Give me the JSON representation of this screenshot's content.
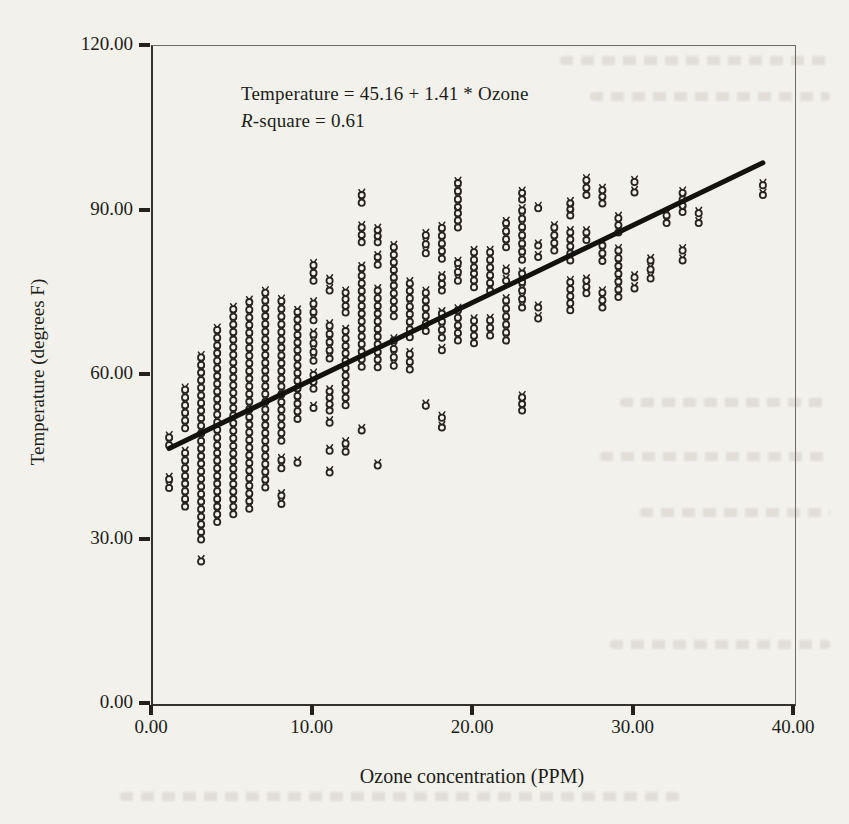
{
  "page": {
    "paper_color": "#f3f1ec",
    "ink_color": "#262320"
  },
  "chart_data": {
    "type": "scatter",
    "title": "",
    "xlabel": "Ozone concentration (PPM)",
    "ylabel": "Temperature (degrees F)",
    "xlim": [
      0,
      40
    ],
    "ylim": [
      0,
      120
    ],
    "grid": false,
    "legend": "none",
    "marker": "open-circle",
    "annotation_line1": "Temperature = 45.16 + 1.41 * Ozone",
    "annotation_line2_prefix": "R",
    "annotation_line2_suffix": "-square = 0.61",
    "regression": {
      "intercept": 45.16,
      "slope": 1.41,
      "r_square": 0.61,
      "x1": 1.0,
      "y1": 46.6,
      "x2": 38.0,
      "y2": 98.7
    },
    "x_ticks": [
      {
        "v": 0,
        "label": "0.00"
      },
      {
        "v": 10,
        "label": "10.00"
      },
      {
        "v": 20,
        "label": "20.00"
      },
      {
        "v": 30,
        "label": "30.00"
      },
      {
        "v": 40,
        "label": "40.00"
      }
    ],
    "y_ticks": [
      {
        "v": 0,
        "label": "0.00"
      },
      {
        "v": 30,
        "label": "30.00"
      },
      {
        "v": 60,
        "label": "60.00"
      },
      {
        "v": 90,
        "label": "90.00"
      },
      {
        "v": 120,
        "label": "120.00"
      }
    ],
    "point_step_degF": 1.4,
    "columns": [
      {
        "x": 1,
        "runs": [
          [
            48.6,
            47.2
          ]
        ],
        "singles": [
          41.0,
          39.4
        ]
      },
      {
        "x": 2,
        "runs": [
          [
            57.3,
            50.3
          ],
          [
            45.8,
            36.0
          ]
        ],
        "singles": []
      },
      {
        "x": 3,
        "runs": [
          [
            63.2,
            30.0
          ]
        ],
        "singles": [
          26.0
        ]
      },
      {
        "x": 4,
        "runs": [
          [
            68.2,
            33.2
          ]
        ],
        "singles": []
      },
      {
        "x": 5,
        "runs": [
          [
            72.0,
            34.6
          ]
        ],
        "singles": []
      },
      {
        "x": 6,
        "runs": [
          [
            73.3,
            35.6
          ]
        ],
        "singles": []
      },
      {
        "x": 7,
        "runs": [
          [
            75.0,
            39.5
          ]
        ],
        "singles": []
      },
      {
        "x": 8,
        "runs": [
          [
            73.5,
            48.0
          ]
        ],
        "singles": [
          44.5,
          43.0,
          38.0,
          36.5
        ]
      },
      {
        "x": 9,
        "runs": [
          [
            71.5,
            52.0
          ]
        ],
        "singles": [
          44.0
        ]
      },
      {
        "x": 10,
        "runs": [
          [
            80.0,
            77.2
          ],
          [
            73.0,
            70.0
          ],
          [
            67.4,
            62.6
          ],
          [
            60.0,
            57.5
          ]
        ],
        "singles": [
          54.0
        ]
      },
      {
        "x": 11,
        "runs": [
          [
            77.2,
            75.4
          ],
          [
            69.0,
            63.0
          ],
          [
            57.0,
            53.5
          ]
        ],
        "singles": [
          51.3,
          46.2,
          42.2
        ]
      },
      {
        "x": 12,
        "runs": [
          [
            75.0,
            71.4
          ],
          [
            68.0,
            54.5
          ]
        ],
        "singles": [
          47.5,
          46.0
        ]
      },
      {
        "x": 13,
        "runs": [
          [
            92.8,
            91.4
          ],
          [
            86.9,
            84.2
          ],
          [
            79.5,
            61.5
          ]
        ],
        "singles": [
          49.9
        ]
      },
      {
        "x": 14,
        "runs": [
          [
            86.4,
            84.2
          ],
          [
            81.5,
            80.1
          ],
          [
            75.4,
            61.4
          ]
        ],
        "singles": [
          43.5
        ]
      },
      {
        "x": 15,
        "runs": [
          [
            83.3,
            77.8
          ],
          [
            76.3,
            70.7
          ],
          [
            66.3,
            61.7
          ]
        ],
        "singles": []
      },
      {
        "x": 16,
        "runs": [
          [
            76.7,
            74.0
          ],
          [
            72.5,
            66.9
          ],
          [
            63.8,
            61.0
          ]
        ],
        "singles": []
      },
      {
        "x": 17,
        "runs": [
          [
            85.5,
            82.2
          ],
          [
            75.0,
            68.0
          ]
        ],
        "singles": [
          54.4
        ]
      },
      {
        "x": 18,
        "runs": [
          [
            86.8,
            81.2
          ],
          [
            77.8,
            75.4
          ],
          [
            71.2,
            66.8
          ]
        ],
        "singles": [
          64.5,
          52.2,
          50.4
        ]
      },
      {
        "x": 19,
        "runs": [
          [
            95.0,
            90.6
          ],
          [
            89.5,
            86.9
          ],
          [
            80.4,
            77.2
          ],
          [
            71.8,
            66.3
          ]
        ],
        "singles": []
      },
      {
        "x": 20,
        "runs": [
          [
            82.4,
            79.6
          ],
          [
            78.5,
            76.0
          ],
          [
            69.9,
            65.8
          ]
        ],
        "singles": []
      },
      {
        "x": 21,
        "runs": [
          [
            82.4,
            75.4
          ],
          [
            70.0,
            67.2
          ]
        ],
        "singles": []
      },
      {
        "x": 22,
        "runs": [
          [
            87.7,
            83.3
          ],
          [
            79.0,
            77.2
          ],
          [
            73.6,
            66.3
          ]
        ],
        "singles": []
      },
      {
        "x": 23,
        "runs": [
          [
            93.2,
            92.0
          ],
          [
            90.0,
            81.0
          ],
          [
            78.5,
            72.3
          ],
          [
            55.9,
            53.5
          ]
        ],
        "singles": []
      },
      {
        "x": 24,
        "runs": [
          [
            83.6,
            81.5
          ],
          [
            72.3,
            70.3
          ]
        ],
        "singles": [
          90.4
        ]
      },
      {
        "x": 25,
        "runs": [
          [
            86.9,
            82.7
          ]
        ],
        "singles": []
      },
      {
        "x": 26,
        "runs": [
          [
            91.3,
            89.1
          ],
          [
            86.0,
            80.9
          ],
          [
            76.9,
            71.8
          ]
        ],
        "singles": []
      },
      {
        "x": 27,
        "runs": [
          [
            95.5,
            92.8
          ],
          [
            86.0,
            84.6
          ],
          [
            77.2,
            74.9
          ]
        ],
        "singles": []
      },
      {
        "x": 28,
        "runs": [
          [
            93.7,
            91.3
          ],
          [
            83.6,
            80.8
          ],
          [
            75.0,
            72.3
          ]
        ],
        "singles": []
      },
      {
        "x": 29,
        "runs": [
          [
            88.6,
            86.0
          ],
          [
            82.7,
            74.2
          ]
        ],
        "singles": []
      },
      {
        "x": 30,
        "runs": [
          [
            95.2,
            93.3
          ],
          [
            77.8,
            75.8
          ]
        ],
        "singles": []
      },
      {
        "x": 31,
        "runs": [
          [
            80.9,
            77.6
          ]
        ],
        "singles": []
      },
      {
        "x": 32,
        "runs": [
          [
            89.1,
            87.7
          ]
        ],
        "singles": []
      },
      {
        "x": 33,
        "runs": [
          [
            93.2,
            89.7
          ],
          [
            82.7,
            80.9
          ]
        ],
        "singles": []
      },
      {
        "x": 34,
        "runs": [
          [
            89.5,
            87.7
          ]
        ],
        "singles": []
      },
      {
        "x": 38,
        "runs": [
          [
            94.6,
            92.8
          ]
        ],
        "singles": []
      }
    ]
  }
}
